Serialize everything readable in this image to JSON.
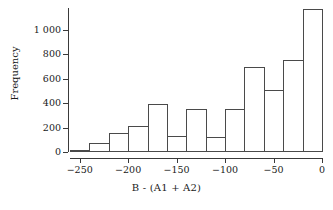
{
  "chart_data": {
    "type": "bar",
    "title": "",
    "subtitle": "",
    "xlabel": "B - (A1 + A2)",
    "ylabel": "Frequency",
    "bin_width": 20,
    "bin_edges": [
      -260,
      -240,
      -220,
      -200,
      -180,
      -160,
      -140,
      -120,
      -100,
      -80,
      -60,
      -40,
      -20,
      0
    ],
    "categories": [
      "-260 to -240",
      "-240 to -220",
      "-220 to -200",
      "-200 to -180",
      "-180 to -160",
      "-160 to -140",
      "-140 to -120",
      "-120 to -100",
      "-100 to -80",
      "-80 to -60",
      "-60 to -40",
      "-40 to -20",
      "-20 to 0"
    ],
    "bin_centers": [
      -250,
      -230,
      -210,
      -190,
      -170,
      -150,
      -130,
      -110,
      -90,
      -70,
      -50,
      -30,
      -10
    ],
    "values": [
      20,
      70,
      155,
      215,
      390,
      130,
      350,
      125,
      350,
      700,
      505,
      750,
      1170
    ],
    "xlim": [
      -260,
      0
    ],
    "ylim": [
      0,
      1180
    ],
    "xticks": [
      -250,
      -200,
      -150,
      -100,
      -50,
      0
    ],
    "xtick_labels": [
      "−250",
      "−200",
      "−150",
      "−100",
      "−50",
      "0"
    ],
    "yticks": [
      0,
      200,
      400,
      600,
      800,
      1000
    ],
    "ytick_labels": [
      "0",
      "200",
      "400",
      "600",
      "800",
      "1 000"
    ],
    "grid": false,
    "legend": null,
    "bar_fill_color": "#ffffff",
    "bar_edge_color": "#4a4a4a",
    "axis_color": "#3a3a3a",
    "text_color": "#1a1a1a",
    "background_color": "#ffffff"
  }
}
